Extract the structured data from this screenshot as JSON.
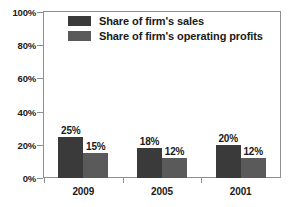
{
  "chart_data": {
    "type": "bar",
    "title": "",
    "subtitle": "",
    "xlabel": "",
    "ylabel": "",
    "categories": [
      "2009",
      "2005",
      "2001"
    ],
    "series": [
      {
        "name": "Share of firm's sales",
        "color": "#3a3a3a",
        "values": [
          25,
          18,
          20
        ],
        "labels": [
          "25%",
          "18%",
          "20%"
        ]
      },
      {
        "name": "Share of firm's operating profits",
        "color": "#5a5a5a",
        "values": [
          15,
          12,
          12
        ],
        "labels": [
          "15%",
          "12%",
          "12%"
        ]
      }
    ],
    "ylim": [
      0,
      100
    ],
    "yticks": [
      0,
      20,
      40,
      60,
      80,
      100
    ],
    "ytick_labels": [
      "0%",
      "20%",
      "40%",
      "60%",
      "80%",
      "100%"
    ],
    "grid": false,
    "legend_position": "top-left-inside",
    "frame_color": "#8e8e8e",
    "text_color": "#1a1a1a",
    "background": "#ffffff"
  }
}
